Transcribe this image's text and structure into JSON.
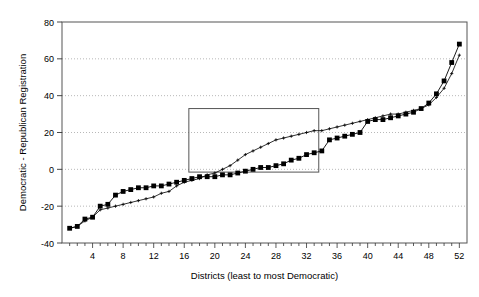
{
  "chart_data": {
    "type": "line",
    "title": "",
    "xlabel": "Districts (least to most Democratic)",
    "ylabel": "Democratic - Republican Registration",
    "xlim": [
      0,
      53
    ],
    "ylim": [
      -40,
      80
    ],
    "xticks": [
      4,
      8,
      12,
      16,
      20,
      24,
      28,
      32,
      36,
      40,
      44,
      48,
      52
    ],
    "yticks": [
      -40,
      -20,
      0,
      20,
      40,
      60,
      80
    ],
    "grid": true,
    "legend": "none",
    "x": [
      1,
      2,
      3,
      4,
      5,
      6,
      7,
      8,
      9,
      10,
      11,
      12,
      13,
      14,
      15,
      16,
      17,
      18,
      19,
      20,
      21,
      22,
      23,
      24,
      25,
      26,
      27,
      28,
      29,
      30,
      31,
      32,
      33,
      34,
      35,
      36,
      37,
      38,
      39,
      40,
      41,
      42,
      43,
      44,
      45,
      46,
      47,
      48,
      49,
      50,
      51,
      52
    ],
    "series": [
      {
        "name": "series-squares",
        "marker": "filled-square",
        "values": [
          -32,
          -31,
          -27,
          -26,
          -20,
          -19,
          -14,
          -12,
          -11,
          -10,
          -10,
          -9,
          -9,
          -8,
          -7,
          -6,
          -5,
          -4,
          -4,
          -4,
          -3,
          -3,
          -2,
          -1,
          0,
          1,
          1,
          2,
          3,
          5,
          6,
          8,
          9,
          10,
          16,
          17,
          18,
          19,
          20,
          26,
          27,
          27,
          28,
          29,
          30,
          31,
          33,
          36,
          41,
          48,
          58,
          68
        ]
      },
      {
        "name": "series-line",
        "marker": "small-cross",
        "values": [
          -32,
          -31,
          -28,
          -26,
          -22,
          -21,
          -20,
          -19,
          -18,
          -17,
          -16,
          -15,
          -13,
          -12,
          -9,
          -7,
          -6,
          -5,
          -3,
          -2,
          0,
          2,
          5,
          8,
          10,
          12,
          14,
          16,
          17,
          18,
          19,
          20,
          21,
          21,
          22,
          23,
          24,
          25,
          26,
          27,
          28,
          29,
          30,
          30,
          31,
          32,
          33,
          35,
          39,
          44,
          52,
          62
        ]
      }
    ],
    "annotation_box": {
      "x0": 16.6,
      "x1": 33.6,
      "y0": -1.5,
      "y1": 33.0
    }
  }
}
